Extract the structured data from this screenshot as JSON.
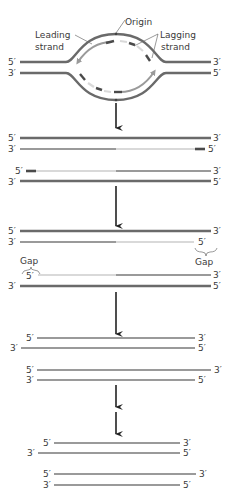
{
  "colors": {
    "parental_strand": "#6a6a6a",
    "new_strand_mid": "#9a9a9a",
    "new_strand_light": "#d9d9d9",
    "rna_primer": "#4a4a4a",
    "arrow": "#222222",
    "text": "#3a3a3a"
  },
  "stage1": {
    "labels": {
      "origin": "Origin",
      "leading_line1": "Leading",
      "leading_line2": "strand",
      "lagging_line1": "Lagging",
      "lagging_line2": "strand"
    },
    "ends": {
      "top_left": "5′",
      "top_right": "3′",
      "bottom_left": "3′",
      "bottom_right": "5′"
    }
  },
  "stage2": {
    "duplex_a": {
      "top_left": "5′",
      "top_right": "3′",
      "bottom_left": "3′",
      "bottom_right": "5′"
    },
    "duplex_b": {
      "top_left": "5′",
      "top_right": "3′",
      "bottom_left": "3′",
      "bottom_right": "5′"
    }
  },
  "stage3": {
    "duplex_a": {
      "top_left": "5′",
      "top_right": "3′",
      "bottom_left": "3′",
      "bottom_right": "5′",
      "gap_label": "Gap"
    },
    "duplex_b": {
      "top_left": "5′",
      "top_right": "3′",
      "bottom_left": "3′",
      "bottom_right": "5′",
      "gap_label": "Gap"
    }
  },
  "stage4": {
    "duplex_a": {
      "top_left": "5′",
      "top_right": "3′",
      "bottom_left": "3′",
      "bottom_right": "5′"
    },
    "duplex_b": {
      "top_left": "5′",
      "top_right": "3′",
      "bottom_left": "3′",
      "bottom_right": "5′"
    }
  },
  "stage5": {
    "duplex_a": {
      "top_left": "5′",
      "top_right": "3′",
      "bottom_left": "3′",
      "bottom_right": "5′"
    },
    "duplex_b": {
      "top_left": "5′",
      "top_right": "3′",
      "bottom_left": "3′",
      "bottom_right": "5′"
    }
  }
}
